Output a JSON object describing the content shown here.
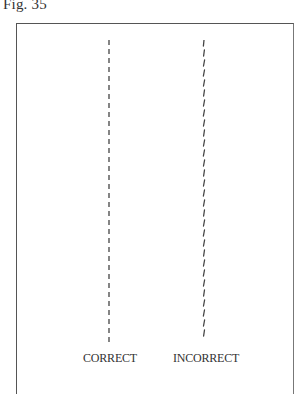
{
  "figure": {
    "label": "Fig. 35",
    "lines": [
      {
        "id": "correct",
        "style": "straight-dashed",
        "caption": "CORRECT"
      },
      {
        "id": "incorrect",
        "style": "wavy-dashed",
        "caption": "INCORRECT"
      }
    ]
  },
  "colors": {
    "ink": "#333333",
    "frame": "#555555",
    "background": "#ffffff"
  }
}
